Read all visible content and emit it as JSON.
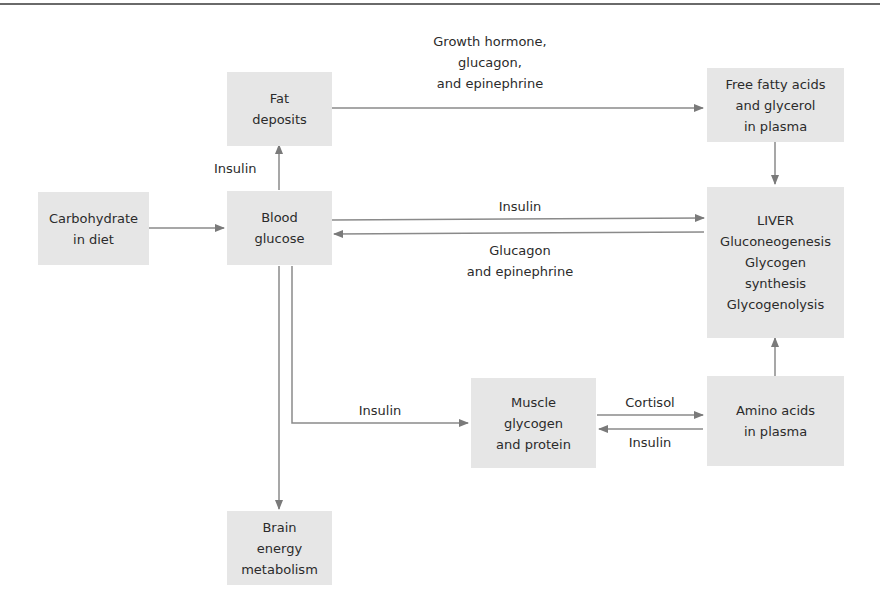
{
  "nodes": {
    "carbohydrate": [
      "Carbohydrate",
      "in diet"
    ],
    "blood_glucose": [
      "Blood",
      "glucose"
    ],
    "fat_deposits": [
      "Fat",
      "deposits"
    ],
    "free_fatty_acids": [
      "Free fatty acids",
      "and glycerol",
      "in plasma"
    ],
    "liver": [
      "LIVER",
      "Gluconeogenesis",
      "Glycogen",
      "synthesis",
      "Glycogenolysis"
    ],
    "muscle": [
      "Muscle",
      "glycogen",
      "and protein"
    ],
    "amino_acids": [
      "Amino acids",
      "in plasma"
    ],
    "brain": [
      "Brain",
      "energy",
      "metabolism"
    ]
  },
  "edges": {
    "fat_to_ffa": [
      "Growth hormone,",
      "glucagon,",
      "and epinephrine"
    ],
    "glucose_to_fat": [
      "Insulin"
    ],
    "glucose_to_liver": [
      "Insulin"
    ],
    "liver_to_glucose": [
      "Glucagon",
      "and epinephrine"
    ],
    "glucose_to_muscle": [
      "Insulin"
    ],
    "muscle_to_amino": [
      "Cortisol"
    ],
    "amino_to_muscle": [
      "Insulin"
    ]
  },
  "colors": {
    "box": "#e6e6e6",
    "arrow": "#7a7a7a",
    "text": "#2b2b2b"
  }
}
